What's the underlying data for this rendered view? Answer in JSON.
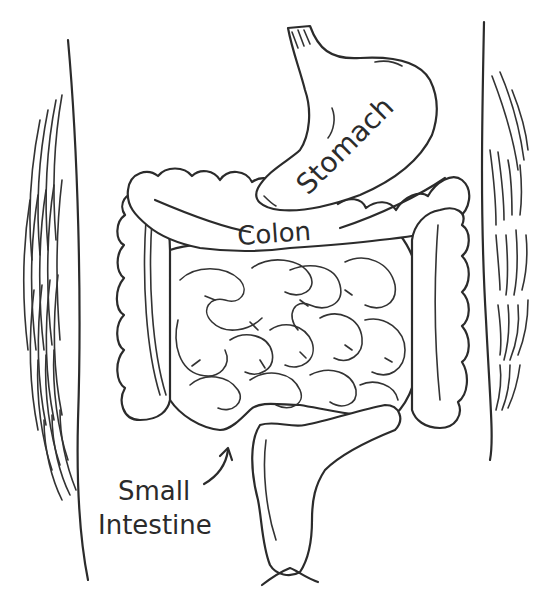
{
  "diagram": {
    "labels": {
      "stomach": "Stomach",
      "colon": "Colon",
      "small_intestine_line1": "Small",
      "small_intestine_line2": "Intestine"
    },
    "colors": {
      "line": "#2b2b2b",
      "background": "#ffffff"
    }
  }
}
